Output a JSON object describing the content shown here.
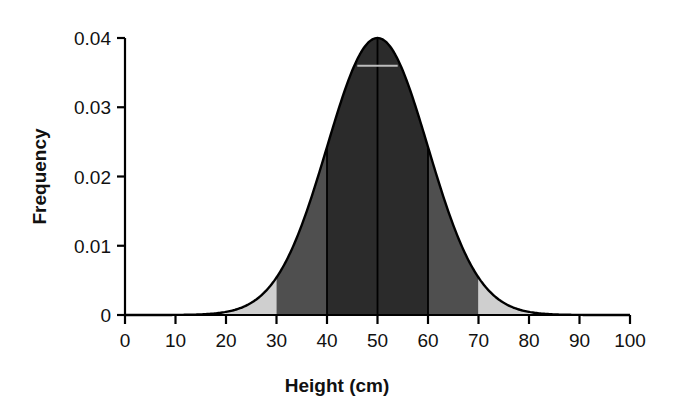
{
  "chart_data": {
    "type": "area",
    "title": "",
    "xlabel": "Height (cm)",
    "ylabel": "Frequency",
    "xlim": [
      0,
      100
    ],
    "ylim": [
      0,
      0.04
    ],
    "grid": false,
    "legend": null,
    "distribution": {
      "kind": "normal",
      "mean": 50,
      "sd": 10,
      "peak_value": 0.04
    },
    "x_ticks": [
      0,
      10,
      20,
      30,
      40,
      50,
      60,
      70,
      80,
      90,
      100
    ],
    "x_tick_labels": [
      "0",
      "10",
      "20",
      "30",
      "40",
      "50",
      "60",
      "70",
      "80",
      "90",
      "100"
    ],
    "y_ticks": [
      0,
      0.01,
      0.02,
      0.03,
      0.04
    ],
    "y_tick_labels": [
      "0",
      "0.01",
      "0.02",
      "0.03",
      "0.04"
    ],
    "x": [
      0,
      5,
      10,
      15,
      20,
      25,
      30,
      35,
      40,
      45,
      50,
      55,
      60,
      65,
      70,
      75,
      80,
      85,
      90,
      95,
      100
    ],
    "y": [
      0.0,
      0.0,
      0.0,
      0.0001,
      0.0005,
      0.0018,
      0.0054,
      0.013,
      0.0242,
      0.0352,
      0.0399,
      0.0352,
      0.0242,
      0.013,
      0.0054,
      0.0018,
      0.0005,
      0.0001,
      0.0,
      0.0,
      0.0
    ],
    "shaded_bands": [
      {
        "name": "band-20-30",
        "from": 20,
        "to": 30,
        "color": "#cfcfcf",
        "label": "light-gray-left-tail"
      },
      {
        "name": "band-30-40",
        "from": 30,
        "to": 40,
        "color": "#4f4f4f",
        "label": "medium-gray-left"
      },
      {
        "name": "band-40-60",
        "from": 40,
        "to": 60,
        "color": "#2b2b2b",
        "label": "dark-gray-center"
      },
      {
        "name": "band-60-70",
        "from": 60,
        "to": 70,
        "color": "#4f4f4f",
        "label": "medium-gray-right"
      },
      {
        "name": "band-70-80",
        "from": 70,
        "to": 80,
        "color": "#cfcfcf",
        "label": "light-gray-right-tail"
      }
    ],
    "vertical_markers": [
      40,
      50,
      60
    ],
    "horizontal_marker": {
      "y": 0.036,
      "from": 46,
      "to": 54,
      "color": "#bdbdbd"
    },
    "curve_color": "#000000",
    "axis_color": "#000000"
  }
}
